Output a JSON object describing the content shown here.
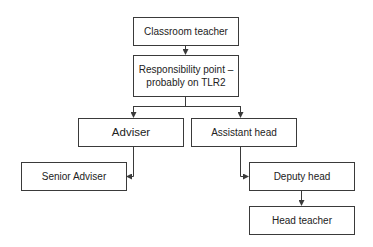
{
  "diagram": {
    "type": "career-progression-flowchart",
    "nodes": [
      {
        "id": "classroom-teacher",
        "label": "Classroom teacher"
      },
      {
        "id": "responsibility-point",
        "label": "Responsibility point –\nprobably on TLR2"
      },
      {
        "id": "adviser",
        "label": "Adviser"
      },
      {
        "id": "assistant-head",
        "label": "Assistant head"
      },
      {
        "id": "senior-adviser",
        "label": "Senior Adviser"
      },
      {
        "id": "deputy-head",
        "label": "Deputy head"
      },
      {
        "id": "head-teacher",
        "label": "Head teacher"
      }
    ],
    "edges": [
      {
        "from": "classroom-teacher",
        "to": "responsibility-point"
      },
      {
        "from": "responsibility-point",
        "to": "adviser"
      },
      {
        "from": "responsibility-point",
        "to": "assistant-head"
      },
      {
        "from": "adviser",
        "to": "senior-adviser"
      },
      {
        "from": "assistant-head",
        "to": "deputy-head"
      },
      {
        "from": "deputy-head",
        "to": "head-teacher"
      }
    ],
    "colors": {
      "line": "#3a3a3a",
      "text": "#222222",
      "background": "#ffffff"
    }
  }
}
